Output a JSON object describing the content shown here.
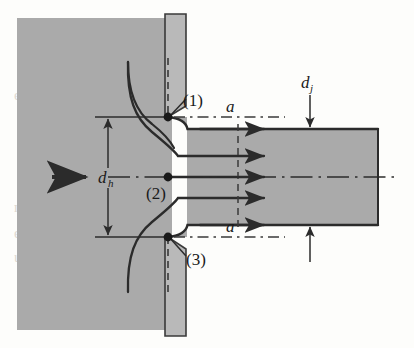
{
  "figure": {
    "name": "orifice-jet-vena-contracta-diagram",
    "background_color": "#fdfdfb",
    "fill_gray": "#aaaaaa",
    "plate_gray": "#b9b9b9",
    "line_color": "#2b2b2b"
  },
  "labels": {
    "point_1": "(1)",
    "point_2": "(2)",
    "point_3": "(3)",
    "section_a_top": "a",
    "section_a_bottom": "a",
    "dia_jet": "d",
    "dia_jet_sub": "j",
    "dia_hole": "d",
    "dia_hole_sub": "h"
  },
  "bleed_text": {
    "line_1": "ead ing p",
    "line_2": "ssure",
    "line_3": "nsion",
    "line_4": "e flow",
    "line_5": "urve"
  },
  "geometry": {
    "tank_left": 17,
    "tank_top": 18,
    "tank_right": 170,
    "tank_bottom": 330,
    "plate_left": 165,
    "plate_right": 187,
    "plate_top": 14,
    "plate_bottom": 336,
    "orifice_top_y": 117,
    "orifice_bottom_y": 237,
    "jet_top_y": 129,
    "jet_bottom_y": 225,
    "jet_right": 378,
    "centerline_y": 177,
    "section_line_x": 238,
    "dim_dh_x": 108,
    "dim_dj_x": 310
  }
}
